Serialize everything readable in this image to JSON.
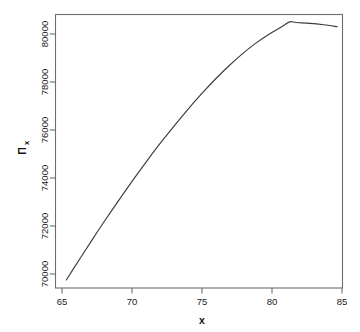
{
  "chart_data": {
    "type": "line",
    "title": "",
    "subtitle": "",
    "xlabel": "x",
    "ylabel": "Π",
    "ylabel_subscript": "x",
    "ylabel_full": "Πx",
    "xlim": [
      64.2,
      85.4
    ],
    "ylim": [
      68700,
      80650
    ],
    "grid": false,
    "legend": null,
    "annotations": [],
    "x_ticks": [
      65,
      70,
      75,
      80,
      85
    ],
    "x_tick_labels": [
      "65",
      "70",
      "75",
      "80",
      "85"
    ],
    "y_ticks": [
      70000,
      72000,
      74000,
      76000,
      78000,
      80000
    ],
    "y_tick_labels": [
      "70000",
      "72000",
      "74000",
      "76000",
      "78000",
      "80000"
    ],
    "series": [
      {
        "name": "Profit",
        "color": "#3a3a42",
        "x": [
          65,
          66,
          67,
          68,
          69,
          70,
          71,
          72,
          73,
          74,
          75,
          76,
          77,
          78,
          79,
          80,
          81,
          81.5,
          82,
          83,
          84,
          85
        ],
        "values": [
          69050,
          69980,
          70890,
          71780,
          72640,
          73480,
          74290,
          75070,
          75810,
          76520,
          77190,
          77820,
          78400,
          78930,
          79400,
          79800,
          80150,
          80330,
          80300,
          80260,
          80200,
          80120
        ]
      }
    ],
    "curve_peak": {
      "x": 81.5,
      "y": 80330
    },
    "curve_start": {
      "x": 65,
      "y": 69050
    },
    "curve_end": {
      "x": 85,
      "y": 80120
    }
  },
  "axes": {
    "x_axis_name": "x-axis",
    "y_axis_name": "y-axis"
  }
}
